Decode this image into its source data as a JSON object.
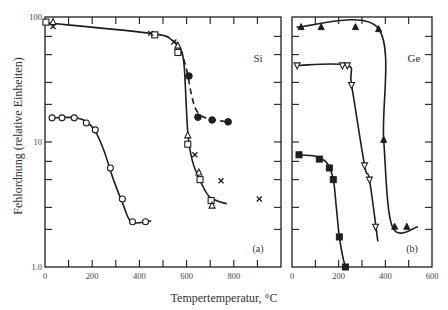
{
  "figure": {
    "ylabel": "Fehlordnung (relative Einheiten)",
    "xlabel": "Tempertemperatur, °C"
  },
  "chart_data": [
    {
      "type": "scatter",
      "panel": "(a)",
      "title": "Si",
      "xlabel": "Tempertemperatur, °C",
      "ylabel": "Fehlordnung (relative Einheiten)",
      "xscale": "linear",
      "yscale": "log",
      "xlim": [
        0,
        1000
      ],
      "ylim": [
        1.0,
        100
      ],
      "xticks": [
        0,
        200,
        400,
        600,
        800
      ],
      "yticks": [
        1.0,
        10,
        100
      ],
      "ytick_labels": [
        "1.0",
        "10",
        "100"
      ],
      "grid": false,
      "legend": null,
      "series": [
        {
          "name": "open squares",
          "marker": "square-open",
          "points": [
            [
              4,
              91
            ],
            [
              465,
              72
            ],
            [
              563,
              52
            ],
            [
              605,
              9.6
            ],
            [
              657,
              5.0
            ],
            [
              704,
              3.4
            ]
          ]
        },
        {
          "name": "open triangles",
          "marker": "triangle-open",
          "points": [
            [
              34,
              91
            ],
            [
              563,
              59
            ],
            [
              605,
              11.3
            ],
            [
              652,
              5.7
            ],
            [
              708,
              3.1
            ]
          ]
        },
        {
          "name": "crosses",
          "marker": "x",
          "points": [
            [
              34,
              84
            ],
            [
              448,
              74
            ],
            [
              546,
              63
            ],
            [
              635,
              7.9
            ],
            [
              746,
              4.9
            ],
            [
              908,
              3.5
            ]
          ]
        },
        {
          "name": "filled circles",
          "marker": "circle-filled",
          "points": [
            [
              610,
              33.7
            ],
            [
              648,
              15.8
            ],
            [
              708,
              15.0
            ],
            [
              776,
              14.5
            ]
          ]
        },
        {
          "name": "open circles",
          "marker": "circle-open",
          "points": [
            [
              30,
              15.6
            ],
            [
              72,
              15.6
            ],
            [
              124,
              15.6
            ],
            [
              175,
              14.2
            ],
            [
              213,
              12.5
            ],
            [
              277,
              6.2
            ],
            [
              328,
              3.5
            ],
            [
              371,
              2.3
            ],
            [
              426,
              2.3
            ]
          ]
        }
      ],
      "curves": [
        {
          "name": "upper solid",
          "style": "solid",
          "points": [
            [
              0,
              90
            ],
            [
              450,
              74
            ],
            [
              540,
              65
            ],
            [
              575,
              55
            ],
            [
              590,
              40
            ],
            [
              605,
              12
            ],
            [
              625,
              7
            ],
            [
              660,
              4.8
            ],
            [
              700,
              3.6
            ],
            [
              770,
              3.2
            ]
          ]
        },
        {
          "name": "dashed (filled circles)",
          "style": "dashed",
          "points": [
            [
              575,
              55
            ],
            [
              600,
              38
            ],
            [
              625,
              22
            ],
            [
              650,
              17
            ],
            [
              700,
              15.2
            ],
            [
              780,
              14.5
            ]
          ]
        },
        {
          "name": "open circles curve",
          "style": "solid",
          "points": [
            [
              30,
              15.6
            ],
            [
              120,
              15.7
            ],
            [
              175,
              14.6
            ],
            [
              215,
              12
            ],
            [
              250,
              8.5
            ],
            [
              290,
              5
            ],
            [
              330,
              3.2
            ],
            [
              365,
              2.3
            ],
            [
              430,
              2.3
            ],
            [
              450,
              2.35
            ]
          ]
        }
      ]
    },
    {
      "type": "scatter",
      "panel": "(b)",
      "title": "Ge",
      "xlabel": "Tempertemperatur, °C",
      "ylabel": "Fehlordnung (relative Einheiten)",
      "xscale": "linear",
      "yscale": "log",
      "xlim": [
        0,
        600
      ],
      "ylim": [
        1.0,
        100
      ],
      "xticks": [
        0,
        200,
        400,
        600
      ],
      "yticks": [
        1.0,
        10,
        100
      ],
      "grid": false,
      "legend": null,
      "series": [
        {
          "name": "filled triangles",
          "marker": "triangle-filled",
          "points": [
            [
              39,
              83
            ],
            [
              125,
              83
            ],
            [
              272,
              83
            ],
            [
              371,
              80
            ],
            [
              393,
              10.4
            ],
            [
              440,
              2.1
            ],
            [
              492,
              2.1
            ]
          ]
        },
        {
          "name": "open inverted triangles",
          "marker": "triangle-down-open",
          "points": [
            [
              22,
              41
            ],
            [
              216,
              41
            ],
            [
              237,
              41
            ],
            [
              255,
              28.6
            ],
            [
              311,
              6.5
            ],
            [
              332,
              5.0
            ],
            [
              358,
              2.1
            ]
          ]
        },
        {
          "name": "filled squares",
          "marker": "square-filled",
          "points": [
            [
              30,
              7.9
            ],
            [
              117,
              7.3
            ],
            [
              160,
              6.2
            ],
            [
              177,
              5.0
            ],
            [
              203,
              1.74
            ],
            [
              229,
              1.0
            ]
          ]
        }
      ],
      "curves": [
        {
          "name": "filled triangles line",
          "style": "solid",
          "points": [
            [
              20,
              83
            ],
            [
              370,
              81
            ],
            [
              393,
              10.4
            ],
            [
              430,
              2.1
            ],
            [
              540,
              2.1
            ]
          ]
        },
        {
          "name": "inverted triangles line",
          "style": "solid",
          "points": [
            [
              20,
              41
            ],
            [
              235,
              41
            ],
            [
              255,
              28.6
            ],
            [
              311,
              6.5
            ],
            [
              332,
              5.0
            ],
            [
              368,
              1.6
            ]
          ]
        },
        {
          "name": "filled squares line",
          "style": "solid",
          "points": [
            [
              20,
              7.9
            ],
            [
              100,
              7.7
            ],
            [
              150,
              6.8
            ],
            [
              177,
              5.0
            ],
            [
              190,
              3
            ],
            [
              203,
              1.74
            ],
            [
              220,
              1.15
            ],
            [
              232,
              1.0
            ]
          ]
        }
      ]
    }
  ]
}
